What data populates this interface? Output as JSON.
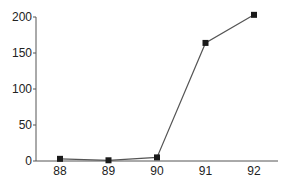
{
  "chart_data": {
    "type": "line",
    "title": "",
    "xlabel": "",
    "ylabel": "",
    "categories": [
      "88",
      "89",
      "90",
      "91",
      "92"
    ],
    "series": [
      {
        "name": "series-1",
        "values": [
          3,
          1,
          5,
          164,
          203
        ],
        "marker": "square",
        "color": "#333333"
      }
    ],
    "ylim": [
      0,
      200
    ],
    "yticks": [
      0,
      50,
      100,
      150,
      200
    ],
    "grid": false,
    "legend": "none"
  },
  "colors": {
    "axis": "#555555",
    "line": "#555555",
    "marker": "#1a1a1a",
    "text": "#222222"
  }
}
